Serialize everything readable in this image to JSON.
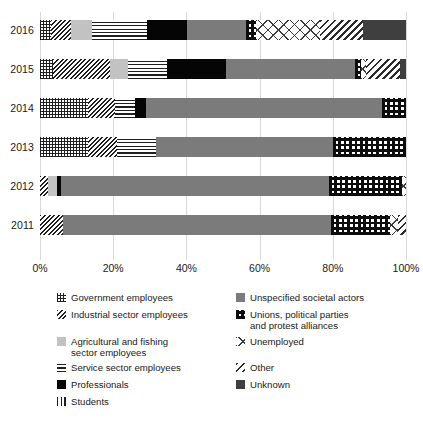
{
  "chart_data": {
    "type": "bar",
    "orientation": "horizontal",
    "stacked": true,
    "normalized": true,
    "title": "",
    "subtitle": "",
    "xlabel": "",
    "ylabel": "",
    "xlim": [
      0,
      100
    ],
    "grid": true,
    "legend_position": "bottom",
    "categories": [
      "2016",
      "2015",
      "2014",
      "2013",
      "2012",
      "2011"
    ],
    "xtick_labels": [
      "0%",
      "20%",
      "40%",
      "60%",
      "80%",
      "100%"
    ],
    "xtick_values": [
      0,
      20,
      40,
      60,
      80,
      100
    ],
    "series": [
      {
        "name": "Government employees",
        "key": "government",
        "pattern": "fine-grid",
        "values": [
          3.0,
          3.6,
          13.1,
          13.1,
          0.0,
          0.0
        ]
      },
      {
        "name": "Industrial sector employees",
        "key": "industrial",
        "pattern": "dense-diagonal-hatch",
        "values": [
          5.5,
          15.6,
          7.4,
          7.9,
          2.2,
          6.3
        ]
      },
      {
        "name": "Agricultural and fishing sector employees",
        "key": "agricultural",
        "pattern": "light-grey-solid",
        "color": "#c2c2c2",
        "values": [
          5.7,
          4.9,
          0.0,
          0.0,
          2.5,
          0.0
        ]
      },
      {
        "name": "Service sector employees",
        "key": "service",
        "pattern": "horizontal-lines",
        "values": [
          15.0,
          10.7,
          5.5,
          10.7,
          0.0,
          0.0
        ]
      },
      {
        "name": "Professionals",
        "key": "professionals",
        "pattern": "black-solid",
        "color": "#050505",
        "values": [
          10.9,
          16.1,
          3.0,
          0.0,
          1.1,
          0.0
        ]
      },
      {
        "name": "Students",
        "key": "students",
        "pattern": "vertical-lines",
        "values": [
          0.0,
          0.0,
          0.0,
          0.0,
          0.0,
          0.0
        ]
      },
      {
        "name": "Unspecified societal actors",
        "key": "unspecified",
        "pattern": "grey-solid",
        "color": "#7b7b7b",
        "values": [
          16.1,
          35.2,
          64.5,
          48.4,
          73.2,
          73.2
        ]
      },
      {
        "name": "Unions, political parties and protest alliances",
        "key": "unions",
        "pattern": "bold-plus-grid",
        "values": [
          2.7,
          1.6,
          6.5,
          19.9,
          20.0,
          16.1
        ]
      },
      {
        "name": "Unemployed",
        "key": "unemployed",
        "pattern": "open-chevron",
        "values": [
          17.5,
          1.4,
          0.0,
          0.0,
          1.0,
          2.2
        ]
      },
      {
        "name": "Other",
        "key": "other",
        "pattern": "diagonal-stripes",
        "values": [
          11.8,
          9.3,
          0.0,
          0.0,
          0.0,
          2.2
        ]
      },
      {
        "name": "Unknown",
        "key": "unknown",
        "pattern": "dark-grey-solid",
        "color": "#3f3f3f",
        "values": [
          11.8,
          1.6,
          0.0,
          0.0,
          0.0,
          0.0
        ]
      }
    ]
  },
  "legend": {
    "left_items": [
      {
        "label": "Government employees",
        "key": "government"
      },
      {
        "label": "Industrial sector employees",
        "key": "industrial"
      },
      {
        "label": "Agricultural and fishing\nsector employees",
        "key": "agricultural"
      },
      {
        "label": "Service sector employees",
        "key": "service"
      },
      {
        "label": "Professionals",
        "key": "professionals"
      },
      {
        "label": "Students",
        "key": "students"
      }
    ],
    "right_items": [
      {
        "label": "Unspecified societal actors",
        "key": "unspecified"
      },
      {
        "label": "Unions, political parties\nand protest alliances",
        "key": "unions"
      },
      {
        "label": "Unemployed",
        "key": "unemployed"
      },
      {
        "label": "Other",
        "key": "other"
      },
      {
        "label": "Unknown",
        "key": "unknown"
      }
    ]
  },
  "colors": {
    "agricultural": "#c2c2c2",
    "professionals": "#050505",
    "unspecified": "#7b7b7b",
    "unknown": "#3f3f3f",
    "gridline": "#d9d9d9",
    "text": "#1a1a1a",
    "background": "#ffffff"
  }
}
